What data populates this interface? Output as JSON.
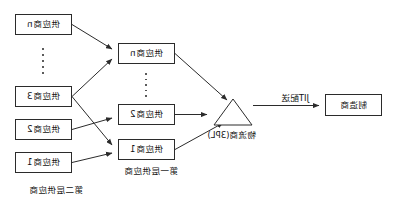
{
  "diagram": {
    "type": "supply-chain-flow",
    "orientation": "mirrored-horizontally",
    "stroke_color": "#2b2b2b",
    "text_color": "#111111",
    "background_color": "#ffffff"
  },
  "manufacturer": {
    "label": "制造商"
  },
  "logistics": {
    "label": "物流商(3PL)",
    "shape": "triangle"
  },
  "flow": {
    "jit_label": "JIT配送"
  },
  "tier1": {
    "caption": "第一层供应商",
    "nodes": [
      {
        "label": "供应商1"
      },
      {
        "label": "供应商2"
      },
      {
        "label": "供应商n"
      }
    ],
    "ellipsis": "⋮"
  },
  "tier2": {
    "caption": "第二层供应商",
    "nodes": [
      {
        "label": "供应商1"
      },
      {
        "label": "供应商2"
      },
      {
        "label": "供应商3"
      },
      {
        "label": "供应商n"
      }
    ],
    "ellipsis": "⋮"
  }
}
